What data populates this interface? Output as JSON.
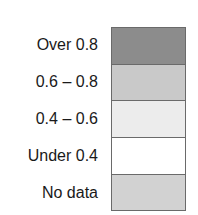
{
  "legend": {
    "items": [
      {
        "label": "Over 0.8",
        "color": "#8c8c8c"
      },
      {
        "label": "0.6 – 0.8",
        "color": "#c9c9c9"
      },
      {
        "label": "0.4 – 0.6",
        "color": "#ececec"
      },
      {
        "label": "Under 0.4",
        "color": "#ffffff"
      },
      {
        "label": "No data",
        "color": "#d2d2d2"
      }
    ]
  }
}
